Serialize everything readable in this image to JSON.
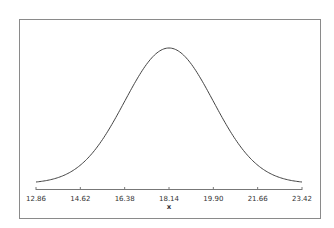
{
  "chart_data": {
    "type": "line",
    "title": "",
    "xlabel": "x",
    "ylabel": "",
    "distribution": {
      "family": "normal",
      "mean": 18.14,
      "sd": 1.76
    },
    "x_ticks": [
      "12.86",
      "14.62",
      "16.38",
      "18.14",
      "19.90",
      "21.66",
      "23.42"
    ],
    "xlim": [
      12.86,
      23.42
    ],
    "grid": false,
    "legend": null,
    "x": [
      12.86,
      13.74,
      14.62,
      15.5,
      16.38,
      17.26,
      18.14,
      19.02,
      19.9,
      20.78,
      21.66,
      22.54,
      23.42
    ],
    "values": [
      0.001,
      0.004,
      0.0137,
      0.0367,
      0.0771,
      0.1269,
      0.2267,
      0.1269,
      0.0771,
      0.0367,
      0.0137,
      0.004,
      0.001
    ],
    "style": {
      "line_color": "#333333",
      "frame_color": "#888888",
      "background": "#ffffff"
    }
  }
}
